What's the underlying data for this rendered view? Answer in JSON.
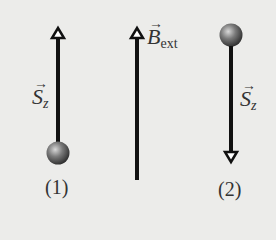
{
  "diagram": {
    "external_field": {
      "symbol": "B",
      "subscript": "ext",
      "direction": "up",
      "arrow_glyph": "→"
    },
    "particles": [
      {
        "id": 1,
        "label": "(1)",
        "spin_symbol": "S",
        "spin_subscript": "z",
        "spin_direction": "up",
        "arrow_glyph": "→"
      },
      {
        "id": 2,
        "label": "(2)",
        "spin_symbol": "S",
        "spin_subscript": "z",
        "spin_direction": "down",
        "arrow_glyph": "→"
      }
    ],
    "colors": {
      "background": "#ececea",
      "arrow": "#111111",
      "ball": "#6a6a6a",
      "text": "#333333"
    }
  }
}
